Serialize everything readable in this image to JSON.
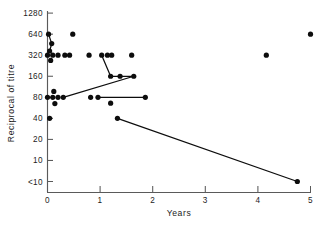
{
  "chart_data": {
    "type": "scatter",
    "title": "",
    "xlabel": "Years",
    "ylabel": "Reciprocal of titre",
    "xlim": [
      0,
      5
    ],
    "ylim_labels": [
      "<10",
      "10",
      "20",
      "40",
      "80",
      "160",
      "320",
      "640",
      "1280"
    ],
    "y_scale": "log2-categorical",
    "grid": false,
    "legend": null,
    "x_ticks": [
      0,
      1,
      2,
      3,
      4,
      5
    ],
    "x_tick_labels": [
      "0",
      "1",
      "2",
      "3",
      "4",
      "5"
    ],
    "y_ticks": [
      0,
      1,
      2,
      3,
      4,
      5,
      6,
      7,
      8
    ],
    "y_tick_labels": [
      "<10",
      "10",
      "20",
      "40",
      "80",
      "160",
      "320",
      "640",
      "1280"
    ],
    "points": [
      {
        "x": 0.02,
        "y": 7
      },
      {
        "x": 0.08,
        "y": 6.55
      },
      {
        "x": 0.04,
        "y": 6.2
      },
      {
        "x": 0.0,
        "y": 6
      },
      {
        "x": 0.1,
        "y": 6
      },
      {
        "x": 0.2,
        "y": 6
      },
      {
        "x": 0.33,
        "y": 6
      },
      {
        "x": 0.42,
        "y": 6
      },
      {
        "x": 0.06,
        "y": 5.75
      },
      {
        "x": 0.48,
        "y": 7
      },
      {
        "x": 0.79,
        "y": 6
      },
      {
        "x": 1.03,
        "y": 6
      },
      {
        "x": 1.14,
        "y": 6
      },
      {
        "x": 1.22,
        "y": 6
      },
      {
        "x": 1.6,
        "y": 6
      },
      {
        "x": 1.2,
        "y": 5
      },
      {
        "x": 1.38,
        "y": 5
      },
      {
        "x": 1.64,
        "y": 5
      },
      {
        "x": 0.0,
        "y": 4
      },
      {
        "x": 0.1,
        "y": 4
      },
      {
        "x": 0.2,
        "y": 4
      },
      {
        "x": 0.3,
        "y": 4
      },
      {
        "x": 0.12,
        "y": 4.28
      },
      {
        "x": 0.14,
        "y": 3.7
      },
      {
        "x": 0.82,
        "y": 4
      },
      {
        "x": 0.96,
        "y": 4
      },
      {
        "x": 1.2,
        "y": 3.72
      },
      {
        "x": 1.86,
        "y": 4
      },
      {
        "x": 0.04,
        "y": 3
      },
      {
        "x": 1.33,
        "y": 3
      },
      {
        "x": 4.16,
        "y": 6
      },
      {
        "x": 5.0,
        "y": 7
      },
      {
        "x": 4.75,
        "y": 0
      }
    ],
    "connectors": [
      {
        "from": {
          "x": 0.02,
          "y": 7
        },
        "to": {
          "x": 0.08,
          "y": 6.55
        }
      },
      {
        "from": {
          "x": 0.08,
          "y": 6.55
        },
        "to": {
          "x": 0.04,
          "y": 6.2
        }
      },
      {
        "from": {
          "x": 1.03,
          "y": 6
        },
        "to": {
          "x": 1.2,
          "y": 5
        }
      },
      {
        "from": {
          "x": 1.2,
          "y": 5
        },
        "to": {
          "x": 1.38,
          "y": 5
        }
      },
      {
        "from": {
          "x": 1.38,
          "y": 5
        },
        "to": {
          "x": 1.64,
          "y": 5
        }
      },
      {
        "from": {
          "x": 1.64,
          "y": 5
        },
        "to": {
          "x": 0.3,
          "y": 4
        }
      },
      {
        "from": {
          "x": 0.96,
          "y": 4
        },
        "to": {
          "x": 1.86,
          "y": 4
        }
      },
      {
        "from": {
          "x": 1.33,
          "y": 3
        },
        "to": {
          "x": 4.75,
          "y": 0
        }
      }
    ]
  }
}
